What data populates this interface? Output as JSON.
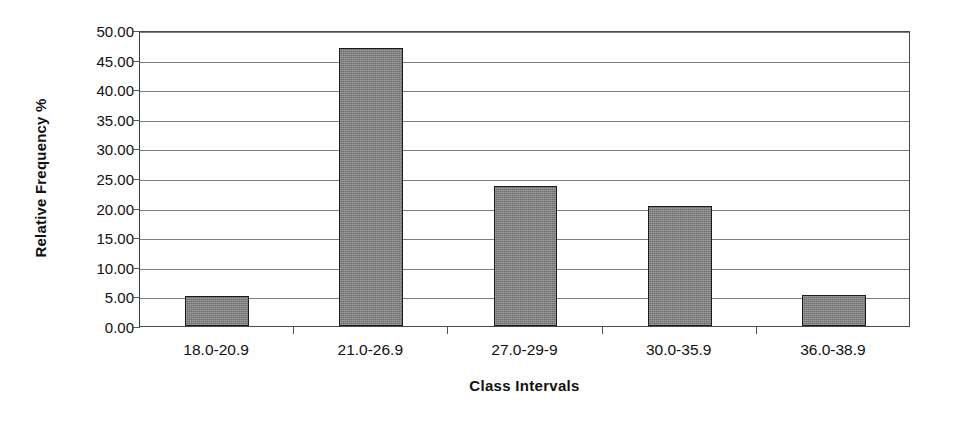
{
  "chart_data": {
    "type": "bar",
    "title": "",
    "subtitle": "",
    "xlabel": "Class Intervals",
    "ylabel": "Relative Frequency %",
    "categories": [
      "18.0-20.9",
      "21.0-26.9",
      "27.0-29-9",
      "30.0-35.9",
      "36.0-38.9"
    ],
    "values": [
      5.0,
      46.9,
      23.6,
      20.2,
      5.2
    ],
    "ylim": [
      0,
      50
    ],
    "ytick_step": 5,
    "ytick_labels": [
      "50.00",
      "45.00",
      "40.00",
      "35.00",
      "30.00",
      "25.00",
      "20.00",
      "15.00",
      "10.00",
      "5.00",
      "0.00"
    ],
    "ytick_values": [
      50,
      45,
      40,
      35,
      30,
      25,
      20,
      15,
      10,
      5,
      0
    ],
    "grid": true,
    "grid_axis": "y",
    "legend": false,
    "legend_position": "none",
    "bar_fill_color": "#838383",
    "bar_edge_color": "#1c1c1c",
    "plot_border_color": "#4a4a4a",
    "gridline_color": "#7d7d7d",
    "background_color": "#ffffff",
    "text_color": "#111111",
    "bar_width_ratio": 0.415,
    "annotations": []
  }
}
